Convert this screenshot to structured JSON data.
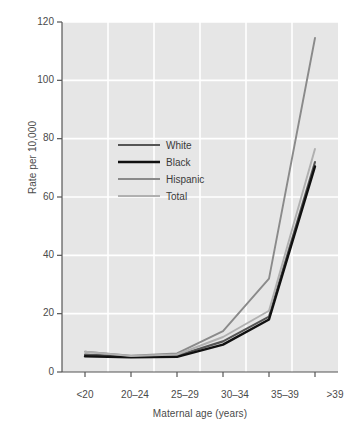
{
  "chart_data": {
    "type": "line",
    "title": "",
    "xlabel": "Maternal age (years)",
    "ylabel": "Rate per 10,000",
    "categories": [
      "<20",
      "20–24",
      "25–29",
      "30–34",
      "35–39",
      ">39"
    ],
    "series": [
      {
        "name": "White",
        "values": [
          6.0,
          5.3,
          5.6,
          10.5,
          19.0,
          72.0
        ],
        "color": "#555555"
      },
      {
        "name": "Black",
        "values": [
          5.4,
          5.0,
          5.2,
          9.4,
          18.0,
          70.5
        ],
        "color": "#111111"
      },
      {
        "name": "Hispanic",
        "values": [
          7.0,
          5.6,
          6.4,
          14.0,
          32.0,
          114.5
        ],
        "color": "#8a8a8a"
      },
      {
        "name": "Total",
        "values": [
          7.0,
          5.5,
          6.0,
          12.0,
          21.0,
          76.5
        ],
        "color": "#b0b0b0"
      }
    ],
    "ylim": [
      0,
      120
    ],
    "yticks": [
      0,
      20,
      40,
      60,
      80,
      100,
      120
    ],
    "ytick_labels": [
      "0",
      "20",
      "40",
      "60",
      "80",
      "100",
      "120"
    ],
    "grid": true,
    "grid_color": "#ffffff",
    "plot_background": "#e6e6e6",
    "figure_background": "#ffffff",
    "axis_color": "#555555",
    "legend": {
      "position": "upper-left-inside",
      "entries": [
        "White",
        "Black",
        "Hispanic",
        "Total"
      ]
    }
  }
}
